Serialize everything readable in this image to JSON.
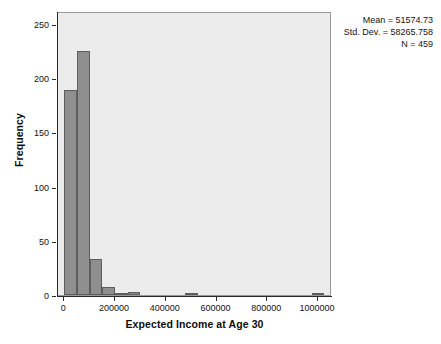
{
  "chart_data": {
    "type": "bar",
    "title": "",
    "subtitle": "",
    "xlabel": "Expected Income at Age 30",
    "ylabel": "Frequency",
    "xlim": [
      -25000,
      1055000
    ],
    "ylim": [
      0,
      262
    ],
    "grid": false,
    "legend": "none",
    "bin_width": 50000,
    "x_ticks": [
      {
        "value": 0,
        "label": "0"
      },
      {
        "value": 200000,
        "label": "200000"
      },
      {
        "value": 400000,
        "label": "400000"
      },
      {
        "value": 600000,
        "label": "600000"
      },
      {
        "value": 800000,
        "label": "800000"
      },
      {
        "value": 1000000,
        "label": "1000000"
      }
    ],
    "y_ticks": [
      {
        "value": 0,
        "label": "0"
      },
      {
        "value": 50,
        "label": "50"
      },
      {
        "value": 100,
        "label": "100"
      },
      {
        "value": 150,
        "label": "150"
      },
      {
        "value": 200,
        "label": "200"
      },
      {
        "value": 250,
        "label": "250"
      }
    ],
    "bins": [
      {
        "x0": 0,
        "x1": 50000,
        "value": 189
      },
      {
        "x0": 50000,
        "x1": 100000,
        "value": 225
      },
      {
        "x0": 100000,
        "x1": 150000,
        "value": 33
      },
      {
        "x0": 150000,
        "x1": 200000,
        "value": 7
      },
      {
        "x0": 200000,
        "x1": 250000,
        "value": 2
      },
      {
        "x0": 250000,
        "x1": 300000,
        "value": 3
      },
      {
        "x0": 475000,
        "x1": 525000,
        "value": 1
      },
      {
        "x0": 975000,
        "x1": 1025000,
        "value": 1
      }
    ],
    "bar_color": "#8f8f8f",
    "bar_border_color": "#5d5d5d",
    "plot_background": "#ececec",
    "axis_color": "#2a2a2a"
  },
  "stats": {
    "mean_line": "Mean = 51574.73",
    "std_dev_line": "Std. Dev. = 58265.758",
    "n_line": "N = 459"
  }
}
